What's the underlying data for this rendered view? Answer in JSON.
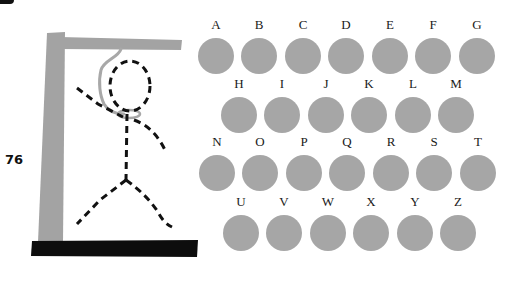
{
  "game": {
    "title": "Hangman",
    "score": "76"
  },
  "colors": {
    "gallows_post": "#a3a3a3",
    "gallows_base": "#0d0d0d",
    "rope": "#a8a8a8",
    "figure_stroke": "#111111",
    "letter_disc": "#a6a6a6",
    "letter_label": "#1a1a1a"
  },
  "keyboard": {
    "rows": [
      [
        "A",
        "B",
        "C",
        "D",
        "E",
        "F",
        "G"
      ],
      [
        "H",
        "I",
        "J",
        "K",
        "L",
        "M"
      ],
      [
        "N",
        "O",
        "P",
        "Q",
        "R",
        "S",
        "T"
      ],
      [
        "U",
        "V",
        "W",
        "X",
        "Y",
        "Z"
      ]
    ]
  },
  "letters": {
    "A": "A",
    "B": "B",
    "C": "C",
    "D": "D",
    "E": "E",
    "F": "F",
    "G": "G",
    "H": "H",
    "I": "I",
    "J": "J",
    "K": "K",
    "L": "L",
    "M": "M",
    "N": "N",
    "O": "O",
    "P": "P",
    "Q": "Q",
    "R": "R",
    "S": "S",
    "T": "T",
    "U": "U",
    "V": "V",
    "W": "W",
    "X": "X",
    "Y": "Y",
    "Z": "Z"
  }
}
